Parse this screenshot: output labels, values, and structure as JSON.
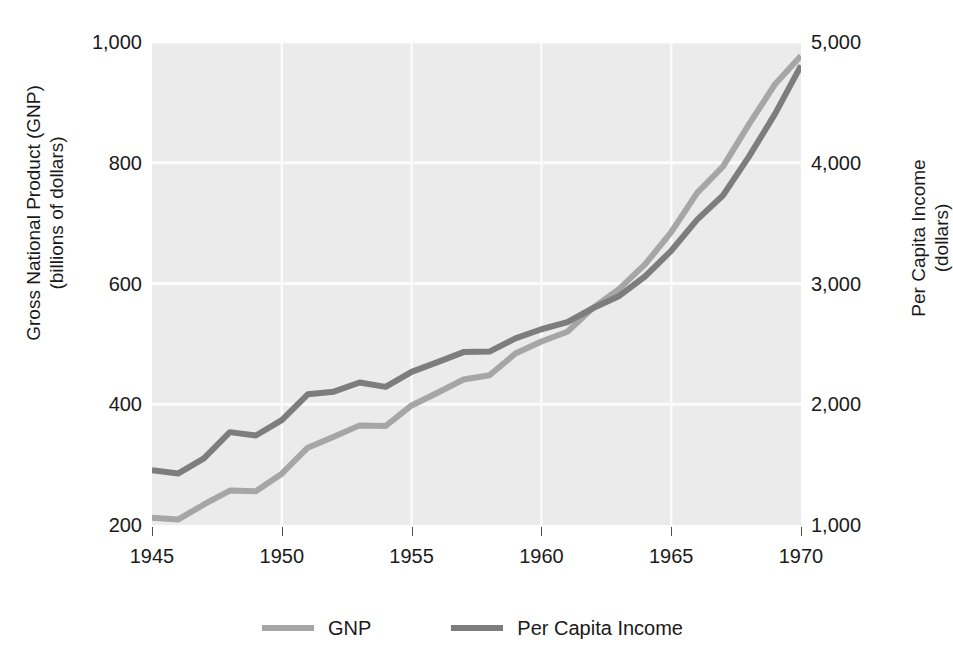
{
  "chart_data": {
    "type": "line",
    "title": "",
    "subtitle": "",
    "xlabel": "",
    "ylabel": "Gross National Product (GNP) (billions of dollars)",
    "ylabel_right": "Per Capita Income (dollars)",
    "grid": true,
    "legend_position": "bottom",
    "x": [
      1945,
      1946,
      1947,
      1948,
      1949,
      1950,
      1951,
      1952,
      1953,
      1954,
      1955,
      1956,
      1957,
      1958,
      1959,
      1960,
      1961,
      1962,
      1963,
      1964,
      1965,
      1966,
      1967,
      1968,
      1969,
      1970
    ],
    "xlim": [
      1945,
      1970
    ],
    "xticks": [
      1945,
      1950,
      1955,
      1960,
      1965,
      1970
    ],
    "xtick_labels": [
      "1945",
      "1950",
      "1955",
      "1960",
      "1965",
      "1970"
    ],
    "ylim": [
      200,
      1000
    ],
    "yticks": [
      200,
      400,
      600,
      800,
      1000
    ],
    "ytick_labels": [
      "200",
      "400",
      "600",
      "800",
      "1,000"
    ],
    "ylim_right": [
      1000,
      5000
    ],
    "yticks_right": [
      1000,
      2000,
      3000,
      4000,
      5000
    ],
    "ytick_labels_right": [
      "1,000",
      "2,000",
      "3,000",
      "4,000",
      "5,000"
    ],
    "series": [
      {
        "name": "GNP",
        "axis": "left",
        "color": "#a6a6a6",
        "unit": "billions of dollars",
        "values": [
          212,
          209,
          234,
          257,
          256,
          285,
          328,
          346,
          365,
          364,
          398,
          419,
          441,
          448,
          484,
          504,
          520,
          560,
          591,
          632,
          685,
          750,
          794,
          864,
          930,
          977
        ]
      },
      {
        "name": "Per Capita Income",
        "axis": "right",
        "color": "#7d7d7d",
        "unit": "dollars",
        "values": [
          1453,
          1426,
          1552,
          1769,
          1741,
          1868,
          2082,
          2104,
          2180,
          2144,
          2268,
          2349,
          2432,
          2436,
          2545,
          2621,
          2681,
          2797,
          2897,
          3060,
          3271,
          3529,
          3731,
          4053,
          4405,
          4805
        ]
      }
    ],
    "annotations": []
  },
  "legend": {
    "items": [
      {
        "label": "GNP",
        "color": "#a6a6a6"
      },
      {
        "label": "Per Capita Income",
        "color": "#7d7d7d"
      }
    ]
  },
  "axes": {
    "left_title_line1": "Gross National Product (GNP)",
    "left_title_line2": "(billions of dollars)",
    "right_title_line1": "Per Capita Income",
    "right_title_line2": "(dollars)"
  },
  "colors": {
    "plot_background": "#ebebeb",
    "gridline": "#fbfbfb",
    "text": "#1a1a1a",
    "gnp": "#a6a6a6",
    "per_capita": "#7d7d7d"
  }
}
